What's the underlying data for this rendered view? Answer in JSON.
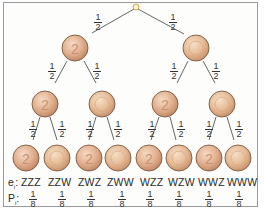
{
  "diagram": {
    "type": "probability-tree",
    "root": {
      "label": ""
    },
    "branch_probability": "1/2",
    "branch_num": "1",
    "branch_den": "2",
    "levels": [
      [
        "Z",
        "W"
      ],
      [
        "Z",
        "W",
        "Z",
        "W"
      ],
      [
        "Z",
        "W",
        "Z",
        "W",
        "Z",
        "W",
        "Z",
        "W"
      ]
    ],
    "coin_faces": {
      "Z": "number side (Zahl) showing numeral 2",
      "W": "coat-of-arms side (Wappen)"
    },
    "colors": {
      "coin_fill": "#e3b796",
      "coin_edge": "#8a6a55",
      "line": "#555555",
      "root_node": "#e8c46a",
      "frame": "#9a9a9a"
    }
  },
  "outcomes_row": {
    "label_e": "e",
    "label_e_sub": "i",
    "label_p": "P",
    "label_p_sub": "i",
    "outcomes": [
      "ZZZ",
      "ZZW",
      "ZWZ",
      "ZWW",
      "WZZ",
      "WZW",
      "WWZ",
      "WWW"
    ],
    "probabilities": [
      {
        "num": "1",
        "den": "8"
      },
      {
        "num": "1",
        "den": "8"
      },
      {
        "num": "1",
        "den": "8"
      },
      {
        "num": "1",
        "den": "8"
      },
      {
        "num": "1",
        "den": "8"
      },
      {
        "num": "1",
        "den": "8"
      },
      {
        "num": "1",
        "den": "8"
      },
      {
        "num": "1",
        "den": "8"
      }
    ]
  }
}
